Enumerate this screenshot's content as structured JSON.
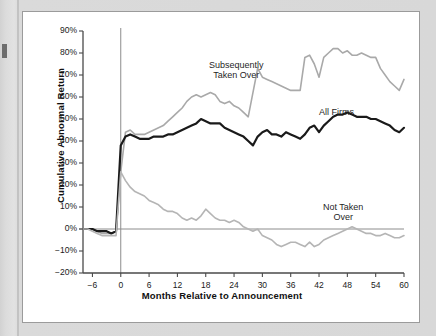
{
  "figure": {
    "background_color": "#d8d8d8",
    "panel_color": "#ffffff",
    "panel_border_color": "#9b9b9b"
  },
  "chart_data": {
    "type": "line",
    "title": "",
    "subtitle": "",
    "xlabel": "Months Relative to Announcement",
    "ylabel": "Cumulative Abnormal Return",
    "xlim": [
      -8,
      60
    ],
    "ylim": [
      -20,
      90
    ],
    "xticks": [
      -6,
      0,
      6,
      12,
      18,
      24,
      30,
      36,
      42,
      48,
      54,
      60
    ],
    "xtick_labels": [
      "−6",
      "0",
      "6",
      "12",
      "18",
      "24",
      "30",
      "36",
      "42",
      "48",
      "54",
      "60"
    ],
    "yticks": [
      -20,
      -10,
      0,
      10,
      20,
      30,
      40,
      50,
      60,
      70,
      80,
      90
    ],
    "ytick_labels": [
      "−20%",
      "−10%",
      "0%",
      "10%",
      "20%",
      "30%",
      "40%",
      "50%",
      "60%",
      "70%",
      "80%",
      "90%"
    ],
    "grid": false,
    "legend_position": "inline-annotations",
    "reference_lines": [
      {
        "name": "zero-return-line",
        "orientation": "horizontal",
        "value": 0,
        "color": "#8c8c8c"
      },
      {
        "name": "announcement-line",
        "orientation": "vertical",
        "value": 0,
        "color": "#8c8c8c"
      }
    ],
    "x": [
      -8,
      -7,
      -6,
      -5,
      -4,
      -3,
      -2,
      -1,
      0,
      1,
      2,
      3,
      4,
      5,
      6,
      7,
      8,
      9,
      10,
      11,
      12,
      13,
      14,
      15,
      16,
      17,
      18,
      19,
      20,
      21,
      22,
      23,
      24,
      25,
      26,
      27,
      28,
      29,
      30,
      31,
      32,
      33,
      34,
      35,
      36,
      37,
      38,
      39,
      40,
      41,
      42,
      43,
      44,
      45,
      46,
      47,
      48,
      49,
      50,
      51,
      52,
      53,
      54,
      55,
      56,
      57,
      58,
      59,
      60
    ],
    "series": [
      {
        "name": "Subsequently Taken Over",
        "color": "#a9a9a9",
        "line_width": 1.6,
        "annotation": "Subsequently\nTaken Over",
        "values": [
          0,
          0,
          0,
          -1,
          -2,
          -2,
          -2,
          -1,
          26,
          44,
          45,
          43,
          43,
          43,
          44,
          45,
          46,
          47,
          49,
          51,
          53,
          55,
          58,
          60,
          61,
          60,
          61,
          62,
          61,
          58,
          57,
          58,
          56,
          55,
          53,
          51,
          62,
          73,
          69,
          68,
          67,
          66,
          65,
          64,
          63,
          63,
          63,
          78,
          79,
          75,
          69,
          78,
          80,
          82,
          82,
          80,
          81,
          79,
          79,
          80,
          79,
          78,
          78,
          73,
          70,
          67,
          65,
          63,
          68
        ]
      },
      {
        "name": "All Firms",
        "color": "#1a1a1a",
        "line_width": 2.2,
        "annotation": "All Firms",
        "values": [
          0,
          0,
          0,
          -1,
          -1,
          -1,
          -2,
          -1,
          38,
          42,
          43,
          42,
          41,
          41,
          41,
          42,
          42,
          42,
          43,
          43,
          44,
          45,
          46,
          47,
          48,
          50,
          49,
          48,
          48,
          48,
          46,
          45,
          44,
          43,
          42,
          40,
          38,
          42,
          44,
          45,
          43,
          43,
          42,
          44,
          43,
          42,
          41,
          43,
          46,
          47,
          44,
          47,
          49,
          51,
          52,
          52,
          53,
          52,
          51,
          51,
          51,
          50,
          50,
          49,
          48,
          47,
          45,
          44,
          46
        ]
      },
      {
        "name": "Not Taken Over",
        "color": "#b5b5b5",
        "line_width": 1.6,
        "annotation": "Not Taken\nOver",
        "values": [
          0,
          0,
          -1,
          -2,
          -3,
          -3,
          -3,
          -3,
          26,
          22,
          19,
          17,
          16,
          15,
          13,
          12,
          11,
          9,
          8,
          8,
          7,
          5,
          4,
          5,
          4,
          6,
          9,
          7,
          5,
          4,
          4,
          3,
          4,
          3,
          1,
          0,
          -1,
          0,
          -3,
          -4,
          -5,
          -7,
          -8,
          -7,
          -6,
          -6,
          -7,
          -8,
          -6,
          -8,
          -7,
          -5,
          -4,
          -3,
          -2,
          -1,
          0,
          1,
          0,
          -1,
          -2,
          -2,
          -3,
          -3,
          -2,
          -3,
          -4,
          -4,
          -3
        ]
      }
    ]
  }
}
